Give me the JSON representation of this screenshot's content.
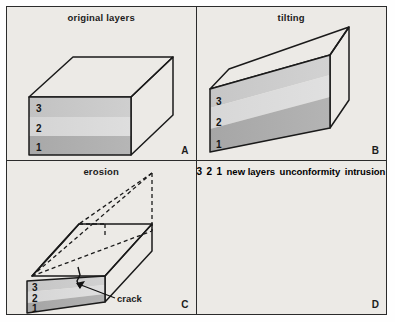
{
  "figure": {
    "type": "geological-block-diagram",
    "background_color": "#eceae6",
    "border_color": "#2b2b2b",
    "line_color": "#1a1a1a"
  },
  "panels": [
    {
      "letter": "A",
      "title": "original layers",
      "stage": "deposition",
      "layer_labels": [
        "3",
        "2",
        "1"
      ],
      "annotations": []
    },
    {
      "letter": "B",
      "title": "tilting",
      "stage": "tilting",
      "layer_labels": [
        "3",
        "2",
        "1"
      ],
      "annotations": []
    },
    {
      "letter": "C",
      "title": "erosion",
      "stage": "erosion",
      "layer_labels": [
        "3",
        "2",
        "1"
      ],
      "annotations": [
        "crack"
      ]
    },
    {
      "letter": "D",
      "title": "",
      "stage": "new deposition",
      "layer_labels": [
        "3",
        "2",
        "1"
      ],
      "annotations": [
        "new layers",
        "unconformity",
        "intrusion"
      ]
    }
  ],
  "labels": {
    "title_a": "original layers",
    "title_b": "tilting",
    "title_c": "erosion",
    "title_d": "new layers",
    "letter_a": "A",
    "letter_b": "B",
    "letter_c": "C",
    "letter_d": "D",
    "crack": "crack",
    "unconformity": "unconformity",
    "intrusion": "intrusion",
    "layer3": "3",
    "layer2": "2",
    "layer1": "1"
  },
  "colors": {
    "layer3": "#c9c9c9",
    "layer2": "#d6d6d6",
    "layer1": "#adadad",
    "top_face": "#d0d0d0",
    "side_face": "#9a9a9a",
    "new_layer_upper": "#d8d8d8",
    "new_layer_lower": "#b4b4b4",
    "intrusion": "#0d0d0d"
  }
}
